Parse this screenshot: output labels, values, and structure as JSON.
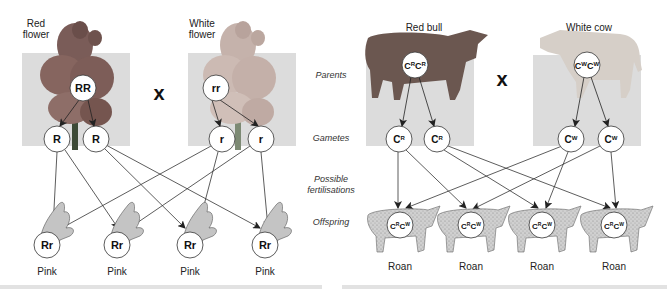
{
  "colors": {
    "panel_bg": "#dcdcdc",
    "arrow": "#333333",
    "circle_fill": "#ffffff",
    "circle_stroke": "#333333",
    "flower_red": "#8a6a66",
    "flower_white": "#c9b7b0",
    "bull": "#6e5a53",
    "cow": "#d8d2cc",
    "offspring_fill": "#c8c8c8",
    "bottom_bar": "#e2e2e2"
  },
  "row_labels": {
    "parents": "Parents",
    "gametes": "Gametes",
    "possible_1": "Possible",
    "possible_2": "fertilisations",
    "offspring": "Offspring"
  },
  "snapdragon": {
    "parent1": {
      "title_1": "Red",
      "title_2": "flower",
      "genotype": "RR"
    },
    "parent2": {
      "title_1": "White",
      "title_2": "flower",
      "genotype": "rr"
    },
    "cross_symbol": "x",
    "gametes": [
      "R",
      "R",
      "r",
      "r"
    ],
    "offspring": [
      {
        "genotype": "Rr",
        "phenotype": "Pink"
      },
      {
        "genotype": "Rr",
        "phenotype": "Pink"
      },
      {
        "genotype": "Rr",
        "phenotype": "Pink"
      },
      {
        "genotype": "Rr",
        "phenotype": "Pink"
      }
    ]
  },
  "cattle": {
    "parent1": {
      "title": "Red bull",
      "allele": "C",
      "sup": "R"
    },
    "parent2": {
      "title": "White cow",
      "allele": "C",
      "sup": "W"
    },
    "cross_symbol": "x",
    "gametes": [
      {
        "base": "C",
        "sup": "R"
      },
      {
        "base": "C",
        "sup": "R"
      },
      {
        "base": "C",
        "sup": "W"
      },
      {
        "base": "C",
        "sup": "W"
      }
    ],
    "offspring": [
      {
        "b1": "C",
        "s1": "R",
        "b2": "C",
        "s2": "W",
        "phenotype": "Roan"
      },
      {
        "b1": "C",
        "s1": "R",
        "b2": "C",
        "s2": "W",
        "phenotype": "Roan"
      },
      {
        "b1": "C",
        "s1": "R",
        "b2": "C",
        "s2": "W",
        "phenotype": "Roan"
      },
      {
        "b1": "C",
        "s1": "R",
        "b2": "C",
        "s2": "W",
        "phenotype": "Roan"
      }
    ]
  }
}
